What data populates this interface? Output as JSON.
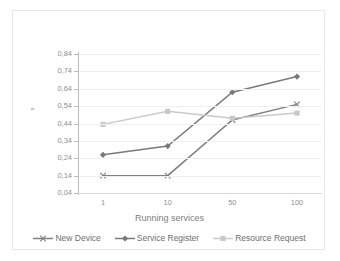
{
  "chart_data": {
    "type": "line",
    "title": "",
    "xlabel": "Running services",
    "ylabel": "s",
    "categories": [
      "1",
      "10",
      "50",
      "100"
    ],
    "ylim": [
      0.04,
      0.84
    ],
    "ytick_step": 0.1,
    "ytick_labels": [
      "0,84",
      "0,74",
      "0,64",
      "0,54",
      "0,44",
      "0,34",
      "0,24",
      "0,14",
      "0,04"
    ],
    "ytick_values": [
      0.84,
      0.74,
      0.64,
      0.54,
      0.44,
      0.34,
      0.24,
      0.14,
      0.04
    ],
    "grid": true,
    "legend_position": "bottom",
    "series": [
      {
        "name": "New Device",
        "values": [
          0.14,
          0.14,
          0.46,
          0.55
        ],
        "color": "#808080",
        "marker": "x"
      },
      {
        "name": "Service Register",
        "values": [
          0.26,
          0.31,
          0.62,
          0.71
        ],
        "color": "#7a7a7a",
        "marker": "diamond"
      },
      {
        "name": "Resource Request",
        "values": [
          0.435,
          0.51,
          0.47,
          0.5
        ],
        "color": "#c9c9c9",
        "marker": "square"
      }
    ]
  },
  "axis": {
    "y_title": "s",
    "x_title": "Running services"
  },
  "legend": {
    "items": [
      {
        "label": "New Device"
      },
      {
        "label": "Service Register"
      },
      {
        "label": "Resource Request"
      }
    ]
  },
  "colors": {
    "series_new_device": "#808080",
    "series_service_register": "#7a7a7a",
    "series_resource_request": "#c9c9c9",
    "gridline": "#efefef",
    "axis": "#bdbdbd",
    "text": "#8f8f8f",
    "frame": "#e8e8e8",
    "background": "#ffffff"
  }
}
